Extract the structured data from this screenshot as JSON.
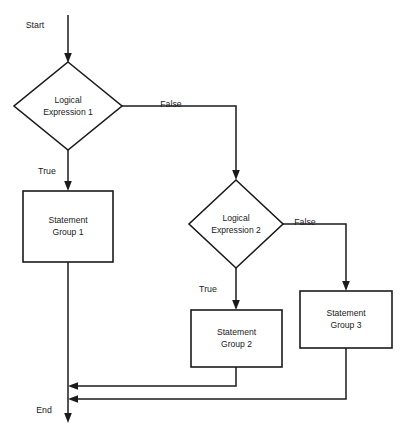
{
  "diagram": {
    "type": "flowchart",
    "background_color": "#ffffff",
    "line_color": "#1b1b1b",
    "shape_fill": "#ffffff",
    "terminals": {
      "start_label": "Start",
      "end_label": "End"
    },
    "nodes": [
      {
        "id": "decision1",
        "shape": "diamond",
        "line1": "Logical",
        "line2": "Expression 1",
        "cx": 68,
        "cy": 106,
        "half_width": 54,
        "half_height": 44
      },
      {
        "id": "decision2",
        "shape": "diamond",
        "line1": "Logical",
        "line2": "Expression 2",
        "cx": 236,
        "cy": 224,
        "half_width": 47,
        "half_height": 44
      },
      {
        "id": "process1",
        "shape": "rectangle",
        "line1": "Statement",
        "line2": "Group 1",
        "x": 23,
        "y": 191,
        "width": 90,
        "height": 71
      },
      {
        "id": "process2",
        "shape": "rectangle",
        "line1": "Statement",
        "line2": "Group 2",
        "x": 191,
        "y": 310,
        "width": 91,
        "height": 57
      },
      {
        "id": "process3",
        "shape": "rectangle",
        "line1": "Statement",
        "line2": "Group 3",
        "x": 300,
        "y": 291,
        "width": 92,
        "height": 57
      }
    ],
    "edge_labels": {
      "d1_false": "False",
      "d1_true": "True",
      "d2_false": "False",
      "d2_true": "True"
    },
    "edges": [
      {
        "from": "start",
        "to": "decision1",
        "label": ""
      },
      {
        "from": "decision1",
        "to": "process1",
        "label": "True"
      },
      {
        "from": "decision1",
        "to": "decision2",
        "label": "False"
      },
      {
        "from": "decision2",
        "to": "process2",
        "label": "True"
      },
      {
        "from": "decision2",
        "to": "process3",
        "label": "False"
      },
      {
        "from": "process1",
        "to": "end",
        "label": ""
      },
      {
        "from": "process2",
        "to": "end",
        "label": ""
      },
      {
        "from": "process3",
        "to": "end",
        "label": ""
      }
    ]
  }
}
